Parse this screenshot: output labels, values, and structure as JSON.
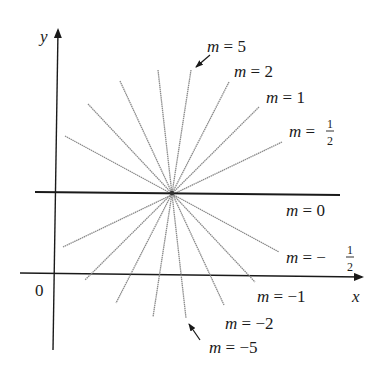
{
  "diagram": {
    "center": {
      "x": 172,
      "y": 193
    },
    "axes": {
      "x_label": "x",
      "y_label": "y",
      "origin_label": "0"
    },
    "lines": [
      {
        "slope_label": "m = 5",
        "m": 5,
        "p1": [
          191,
          70
        ],
        "p2": [
          153,
          317
        ]
      },
      {
        "slope_label": "m = 2",
        "m": 2,
        "p1": [
          229,
          82
        ],
        "p2": [
          116,
          303
        ]
      },
      {
        "slope_label": "m = 1",
        "m": 1,
        "p1": [
          259,
          107
        ],
        "p2": [
          85,
          280
        ]
      },
      {
        "slope_label": "m = 1/2",
        "m": 0.5,
        "p1": [
          282,
          142
        ],
        "p2": [
          63,
          247
        ]
      },
      {
        "slope_label": "m = 0",
        "m": 0,
        "p1": [
          35,
          193
        ],
        "p2": [
          340,
          193
        ]
      },
      {
        "slope_label": "m = -1/2",
        "m": -0.5,
        "p1": [
          65,
          136
        ],
        "p2": [
          279,
          252
        ]
      },
      {
        "slope_label": "m = -1",
        "m": -1,
        "p1": [
          88,
          104
        ],
        "p2": [
          255,
          282
        ]
      },
      {
        "slope_label": "m = -2",
        "m": -2,
        "p1": [
          120,
          81
        ],
        "p2": [
          224,
          305
        ]
      },
      {
        "slope_label": "m = -5",
        "m": -5,
        "p1": [
          158,
          70
        ],
        "p2": [
          186,
          318
        ]
      }
    ],
    "labels": {
      "m5": {
        "var": "m",
        "eq": " = ",
        "val": "5"
      },
      "m2": {
        "var": "m",
        "eq": " = ",
        "val": "2"
      },
      "m1": {
        "var": "m",
        "eq": " = ",
        "val": "1"
      },
      "mhalf": {
        "var": "m",
        "eq": " = ",
        "num": "1",
        "den": "2"
      },
      "m0": {
        "var": "m",
        "eq": " = ",
        "val": "0"
      },
      "mneghalf": {
        "var": "m",
        "eq": " = − ",
        "num": "1",
        "den": "2"
      },
      "mneg1": {
        "var": "m",
        "eq": " = ",
        "val": "−1"
      },
      "mneg2": {
        "var": "m",
        "eq": " = ",
        "val": "−2"
      },
      "mneg5": {
        "var": "m",
        "eq": " = ",
        "val": "−5"
      }
    },
    "colors": {
      "axis": "#1a1a1a",
      "line": "#8a8a8a",
      "horizontal": "#1a1a1a",
      "text": "#1a1a1a"
    }
  }
}
